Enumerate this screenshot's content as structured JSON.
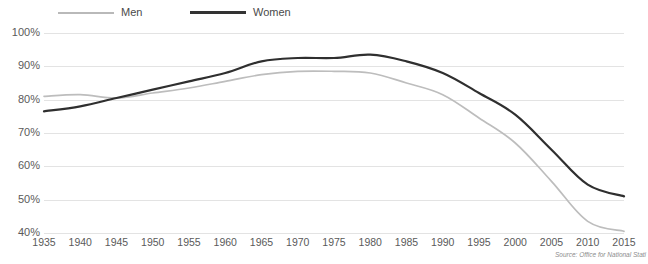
{
  "chart_data": {
    "type": "line",
    "title": "",
    "xlabel": "",
    "ylabel": "",
    "x": [
      1935,
      1940,
      1945,
      1950,
      1955,
      1960,
      1965,
      1970,
      1975,
      1980,
      1985,
      1990,
      1995,
      2000,
      2005,
      2010,
      2015
    ],
    "categories": [
      "1935",
      "1940",
      "1945",
      "1950",
      "1955",
      "1960",
      "1965",
      "1970",
      "1975",
      "1980",
      "1985",
      "1990",
      "1995",
      "2000",
      "2005",
      "2010",
      "2015"
    ],
    "series": [
      {
        "name": "Men",
        "color": "#bdbdbd",
        "values": [
          81.0,
          81.5,
          80.5,
          82.0,
          83.5,
          85.5,
          87.5,
          88.5,
          88.5,
          88.0,
          85.0,
          81.5,
          74.5,
          67.0,
          55.5,
          43.5,
          40.5
        ]
      },
      {
        "name": "Women",
        "color": "#2f2f2f",
        "values": [
          76.5,
          78.0,
          80.5,
          83.0,
          85.5,
          88.0,
          91.5,
          92.5,
          92.5,
          93.5,
          91.5,
          88.0,
          82.0,
          75.5,
          65.0,
          54.5,
          51.0
        ]
      }
    ],
    "ylim": [
      40,
      100
    ],
    "yticks": [
      "40%",
      "50%",
      "60%",
      "70%",
      "80%",
      "90%",
      "100%"
    ],
    "ytick_values": [
      40,
      50,
      60,
      70,
      80,
      90,
      100
    ],
    "grid": true,
    "legend_position": "top-left",
    "value_unit": "%"
  },
  "legend": {
    "men_label": "Men",
    "women_label": "Women"
  },
  "footer": {
    "source": "Source: Office for National Stati"
  },
  "header": {
    "cropped_title": ""
  },
  "colors": {
    "men_line": "#bdbdbd",
    "women_line": "#2f2f2f",
    "gridline": "#e3e3e3",
    "axis_text": "#5a5a5a",
    "legend_text": "#4a4a4a",
    "source_text": "#8d8d8d",
    "background": "#ffffff"
  }
}
